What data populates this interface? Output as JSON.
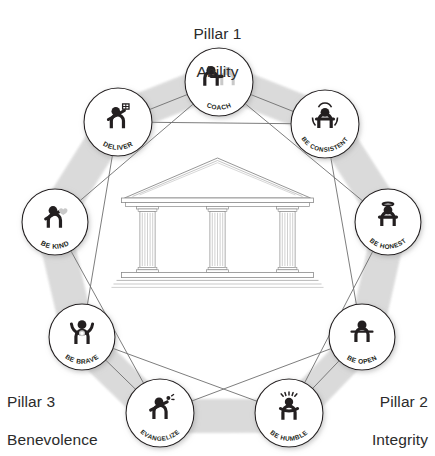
{
  "colors": {
    "ink": "#231f20",
    "band": "#d9d9d9",
    "line": "#6e6e6e",
    "circle_stroke": "#231f20",
    "temple": "#8a8a8a",
    "ghost": "#c9c9c9",
    "background": "#ffffff"
  },
  "pillars": [
    {
      "id": "pillar-1",
      "number": "Pillar 1",
      "name": "Ability",
      "position": "top-center"
    },
    {
      "id": "pillar-2",
      "number": "Pillar 2",
      "name": "Integrity",
      "position": "bottom-right"
    },
    {
      "id": "pillar-3",
      "number": "Pillar 3",
      "name": "Benevolence",
      "position": "bottom-left"
    }
  ],
  "center": {
    "icon": "greek-temple-icon",
    "description": "Classical temple with triangular pediment, three fluted columns and a stepped base",
    "columns": 3
  },
  "nodes": [
    {
      "id": "coach",
      "label": "COACH",
      "icon": "person-coaching-icon",
      "cx": 219,
      "cy": 82,
      "r": 34,
      "arc": "down",
      "label_size": 6.6
    },
    {
      "id": "be-consistent",
      "label": "BE CONSISTENT",
      "icon": "person-rotating-icon",
      "cx": 325,
      "cy": 124,
      "r": 34,
      "arc": "down",
      "label_size": 6.2
    },
    {
      "id": "be-honest",
      "label": "BE HONEST",
      "icon": "person-halo-icon",
      "cx": 388,
      "cy": 222,
      "r": 33,
      "arc": "down",
      "label_size": 6.4
    },
    {
      "id": "be-open",
      "label": "BE OPEN",
      "icon": "person-open-arms-icon",
      "cx": 362,
      "cy": 337,
      "r": 33,
      "arc": "down",
      "label_size": 6.6
    },
    {
      "id": "be-humble",
      "label": "BE HUMBLE",
      "icon": "person-bowing-icon",
      "cx": 289,
      "cy": 413,
      "r": 34,
      "arc": "down",
      "label_size": 6.4
    },
    {
      "id": "evangelize",
      "label": "EVANGELIZE",
      "icon": "person-megaphone-icon",
      "cx": 160,
      "cy": 413,
      "r": 34,
      "arc": "down",
      "label_size": 6.3
    },
    {
      "id": "be-brave",
      "label": "BE BRAVE",
      "icon": "person-arms-raised-icon",
      "cx": 82,
      "cy": 337,
      "r": 33,
      "arc": "down",
      "label_size": 6.6
    },
    {
      "id": "be-kind",
      "label": "BE KIND",
      "icon": "person-holding-heart-icon",
      "cx": 55,
      "cy": 222,
      "r": 33,
      "arc": "down",
      "label_size": 6.8
    },
    {
      "id": "deliver",
      "label": "DELIVER",
      "icon": "person-delivering-icon",
      "cx": 118,
      "cy": 122,
      "r": 34,
      "arc": "down",
      "label_size": 6.8
    }
  ],
  "connections": [
    [
      "deliver",
      "coach"
    ],
    [
      "coach",
      "be-consistent"
    ],
    [
      "deliver",
      "be-consistent"
    ],
    [
      "coach",
      "be-kind"
    ],
    [
      "coach",
      "be-honest"
    ],
    [
      "deliver",
      "be-brave"
    ],
    [
      "be-consistent",
      "be-open"
    ],
    [
      "be-kind",
      "evangelize"
    ],
    [
      "be-honest",
      "be-humble"
    ],
    [
      "be-brave",
      "evangelize"
    ],
    [
      "be-open",
      "be-humble"
    ],
    [
      "evangelize",
      "be-open"
    ],
    [
      "be-humble",
      "be-brave"
    ]
  ]
}
